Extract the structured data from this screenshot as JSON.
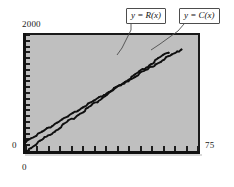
{
  "figure": {
    "title": "",
    "background_color": "#ffffff",
    "plot_background_color": "#bfbfbf",
    "axis_color": "#111111",
    "curve_color": "#101010"
  },
  "axes": {
    "y_max_label": "2000",
    "y_min_label": "0",
    "x_min_label": "0",
    "x_max_label": "75"
  },
  "callouts": {
    "revenue": {
      "lhs": "y",
      "eq": " = ",
      "rhs": "R(x)",
      "full": "y = R(x)"
    },
    "cost": {
      "lhs": "y",
      "eq": " = ",
      "rhs": "C(x)",
      "full": "y = C(x)"
    }
  },
  "chart_data": {
    "type": "line",
    "title": "",
    "xlabel": "",
    "ylabel": "",
    "xlim": [
      0,
      75
    ],
    "ylim": [
      0,
      2000
    ],
    "xticks": [
      0,
      5,
      10,
      15,
      20,
      25,
      30,
      35,
      40,
      45,
      50,
      55,
      60,
      65,
      70,
      75
    ],
    "yticks": [
      0,
      100,
      200,
      300,
      400,
      500,
      600,
      700,
      800,
      900,
      1000,
      1100,
      1200,
      1300,
      1400,
      1500,
      1600,
      1700,
      1800,
      1900,
      2000
    ],
    "xtick_labels": [
      "0",
      "",
      "",
      "",
      "",
      "",
      "",
      "",
      "",
      "",
      "",
      "",
      "",
      "",
      "",
      "75"
    ],
    "ytick_labels": [
      "0",
      "",
      "",
      "",
      "",
      "",
      "",
      "",
      "",
      "",
      "",
      "",
      "",
      "",
      "",
      "",
      "",
      "",
      "",
      "",
      "2000"
    ],
    "grid": false,
    "legend": "callout-labels",
    "series": [
      {
        "name": "y = R(x)",
        "role": "revenue",
        "color": "#101010",
        "intercept": 0,
        "slope": 27.5,
        "x": [
          0,
          5,
          10,
          15,
          20,
          25,
          30,
          35,
          40,
          45,
          50,
          55,
          60,
          62
        ],
        "values": [
          0,
          138,
          275,
          413,
          550,
          688,
          825,
          963,
          1100,
          1238,
          1375,
          1513,
          1650,
          1705
        ]
      },
      {
        "name": "y = C(x)",
        "role": "cost",
        "color": "#101010",
        "intercept": 170,
        "slope": 23.4,
        "x": [
          0,
          5,
          10,
          15,
          20,
          25,
          30,
          35,
          40,
          45,
          50,
          55,
          60,
          65,
          68
        ],
        "values": [
          170,
          287,
          404,
          521,
          638,
          755,
          872,
          989,
          1106,
          1223,
          1340,
          1457,
          1574,
          1691,
          1761
        ]
      }
    ],
    "break_even": {
      "x": 41.5,
      "y": 1141
    }
  }
}
